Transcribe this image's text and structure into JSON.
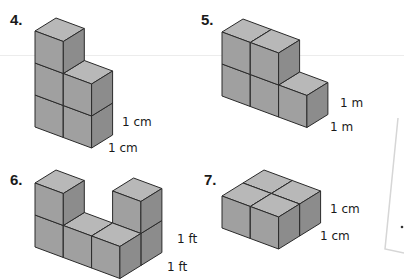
{
  "colors": {
    "top": "#b8b8b8",
    "front": "#a0a0a0",
    "side": "#8c8c8c",
    "edge": "#2a2a2a"
  },
  "projection": {
    "x_vec": [
      28.3,
      10.5
    ],
    "z_vec": [
      21,
      -13
    ],
    "unit_h": 32
  },
  "problems": [
    {
      "number": "4.",
      "number_pos": [
        10,
        11
      ],
      "origin": [
        35,
        127
      ],
      "cubes": [
        [
          0,
          0,
          0
        ],
        [
          0,
          1,
          0
        ],
        [
          0,
          2,
          0
        ],
        [
          1,
          0,
          0
        ],
        [
          1,
          1,
          0
        ]
      ],
      "labels": [
        {
          "text": "1 cm",
          "pos": [
            122,
            115
          ]
        },
        {
          "text": "1 cm",
          "pos": [
            108,
            141
          ]
        }
      ]
    },
    {
      "number": "5.",
      "number_pos": [
        201,
        11
      ],
      "origin": [
        222,
        96
      ],
      "cubes": [
        [
          0,
          0,
          0
        ],
        [
          1,
          0,
          0
        ],
        [
          2,
          0,
          0
        ],
        [
          0,
          1,
          0
        ],
        [
          1,
          1,
          0
        ]
      ],
      "labels": [
        {
          "text": "1 m",
          "pos": [
            340,
            96
          ]
        },
        {
          "text": "1 m",
          "pos": [
            330,
            120
          ]
        }
      ]
    },
    {
      "number": "6.",
      "number_pos": [
        10,
        171
      ],
      "origin": [
        35,
        247
      ],
      "cubes": [
        [
          0,
          0,
          0
        ],
        [
          0,
          1,
          0
        ],
        [
          1,
          0,
          0
        ],
        [
          2,
          0,
          1
        ],
        [
          2,
          1,
          1
        ],
        [
          2,
          0,
          0
        ]
      ],
      "labels": [
        {
          "text": "1 ft",
          "pos": [
            177,
            232
          ]
        },
        {
          "text": "1 ft",
          "pos": [
            167,
            260
          ]
        }
      ]
    },
    {
      "number": "7.",
      "number_pos": [
        204,
        171
      ],
      "origin": [
        222,
        228
      ],
      "cubes": [
        [
          0,
          0,
          1
        ],
        [
          1,
          0,
          1
        ],
        [
          0,
          0,
          0
        ],
        [
          1,
          0,
          0
        ]
      ],
      "labels": [
        {
          "text": "1 cm",
          "pos": [
            330,
            202
          ]
        },
        {
          "text": "1 cm",
          "pos": [
            320,
            229
          ]
        }
      ]
    }
  ],
  "overlay_page": {
    "edge_top": [
      398,
      118
    ],
    "edge_bottom": [
      385,
      249
    ],
    "shadow_end": [
      404,
      253
    ],
    "dot": [
      402,
      227
    ]
  }
}
